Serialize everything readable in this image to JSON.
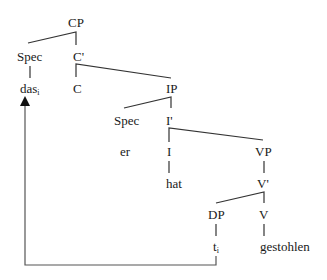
{
  "diagram": {
    "type": "syntax-tree",
    "nodes": {
      "cp": "CP",
      "spec_c": "Spec",
      "c_bar": "C'",
      "das": "das",
      "das_index": "i",
      "c": "C",
      "ip": "IP",
      "spec_i": "Spec",
      "i_bar": "I'",
      "er": "er",
      "i": "I",
      "vp": "VP",
      "hat": "hat",
      "v_bar": "V'",
      "dp": "DP",
      "v": "V",
      "trace": "t",
      "trace_index": "i",
      "gestohlen": "gestohlen"
    },
    "edges": [
      [
        "CP",
        "Spec"
      ],
      [
        "CP",
        "C'"
      ],
      [
        "Spec",
        "das_i"
      ],
      [
        "C'",
        "C"
      ],
      [
        "C'",
        "IP"
      ],
      [
        "IP",
        "Spec"
      ],
      [
        "IP",
        "I'"
      ],
      [
        "Spec",
        "er"
      ],
      [
        "I'",
        "I"
      ],
      [
        "I'",
        "VP"
      ],
      [
        "I",
        "hat"
      ],
      [
        "VP",
        "V'"
      ],
      [
        "V'",
        "DP"
      ],
      [
        "V'",
        "V"
      ],
      [
        "DP",
        "t_i"
      ],
      [
        "V",
        "gestohlen"
      ]
    ],
    "movement_arrow": {
      "from": "t_i",
      "to": "das_i"
    },
    "colors": {
      "line": "#333333",
      "text": "#1a1a1a"
    }
  }
}
